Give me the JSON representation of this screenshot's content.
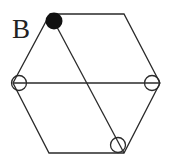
{
  "diagram": {
    "label": "B",
    "colors": {
      "stroke": "#2a2a2a",
      "filled_node": "#111111",
      "background": "#ffffff"
    },
    "hexagon": {
      "vertices": [
        [
          50,
          14
        ],
        [
          124,
          14
        ],
        [
          160,
          83
        ],
        [
          124,
          153
        ],
        [
          49,
          153
        ],
        [
          13,
          83
        ]
      ]
    },
    "lines": [
      {
        "name": "horizontal-diagonal",
        "from": [
          13,
          83
        ],
        "to": [
          160,
          83
        ]
      },
      {
        "name": "slanted-diagonal",
        "from": [
          50,
          14
        ],
        "to": [
          124,
          153
        ]
      }
    ],
    "nodes": [
      {
        "name": "filled-node",
        "cx": 53,
        "cy": 20,
        "r": 9,
        "filled": true
      },
      {
        "name": "open-node-left",
        "cx": 19,
        "cy": 83,
        "r": 8,
        "filled": false
      },
      {
        "name": "open-node-right",
        "cx": 152,
        "cy": 83,
        "r": 8,
        "filled": false
      },
      {
        "name": "open-node-bottom",
        "cx": 117,
        "cy": 145,
        "r": 8,
        "filled": false
      }
    ]
  }
}
